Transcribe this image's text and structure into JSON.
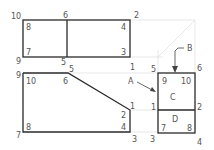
{
  "diagram": {
    "type": "orthographic-projection",
    "views": {
      "top": {
        "labels": [
          {
            "text": "10",
            "x": 11,
            "y": 19
          },
          {
            "text": "6",
            "x": 63,
            "y": 18
          },
          {
            "text": "2",
            "x": 134,
            "y": 18
          },
          {
            "text": "8",
            "x": 26,
            "y": 30
          },
          {
            "text": "4",
            "x": 121,
            "y": 30
          },
          {
            "text": "7",
            "x": 26,
            "y": 55
          },
          {
            "text": "3",
            "x": 121,
            "y": 55
          },
          {
            "text": "9",
            "x": 16,
            "y": 64
          },
          {
            "text": "5",
            "x": 61,
            "y": 65
          },
          {
            "text": "1",
            "x": 130,
            "y": 70
          }
        ]
      },
      "front": {
        "labels": [
          {
            "text": "9",
            "x": 16,
            "y": 78
          },
          {
            "text": "5",
            "x": 69,
            "y": 72
          },
          {
            "text": "10",
            "x": 26,
            "y": 84
          },
          {
            "text": "6",
            "x": 63,
            "y": 84
          },
          {
            "text": "1",
            "x": 130,
            "y": 109
          },
          {
            "text": "2",
            "x": 121,
            "y": 118
          },
          {
            "text": "4",
            "x": 121,
            "y": 130
          },
          {
            "text": "8",
            "x": 26,
            "y": 130
          },
          {
            "text": "7",
            "x": 16,
            "y": 138
          },
          {
            "text": "3",
            "x": 132,
            "y": 142
          }
        ]
      },
      "side": {
        "labels": [
          {
            "text": "5",
            "x": 151,
            "y": 72
          },
          {
            "text": "6",
            "x": 197,
            "y": 71
          },
          {
            "text": "9",
            "x": 162,
            "y": 84
          },
          {
            "text": "10",
            "x": 181,
            "y": 84
          },
          {
            "text": "C",
            "x": 170,
            "y": 100
          },
          {
            "text": "1",
            "x": 151,
            "y": 110
          },
          {
            "text": "2",
            "x": 197,
            "y": 110
          },
          {
            "text": "D",
            "x": 172,
            "y": 122
          },
          {
            "text": "7",
            "x": 161,
            "y": 131
          },
          {
            "text": "8",
            "x": 187,
            "y": 131
          },
          {
            "text": "3",
            "x": 150,
            "y": 142
          },
          {
            "text": "4",
            "x": 197,
            "y": 145
          }
        ]
      }
    },
    "callouts": [
      {
        "text": "A",
        "x": 128,
        "y": 84
      },
      {
        "text": "B",
        "x": 187,
        "y": 51
      }
    ]
  }
}
